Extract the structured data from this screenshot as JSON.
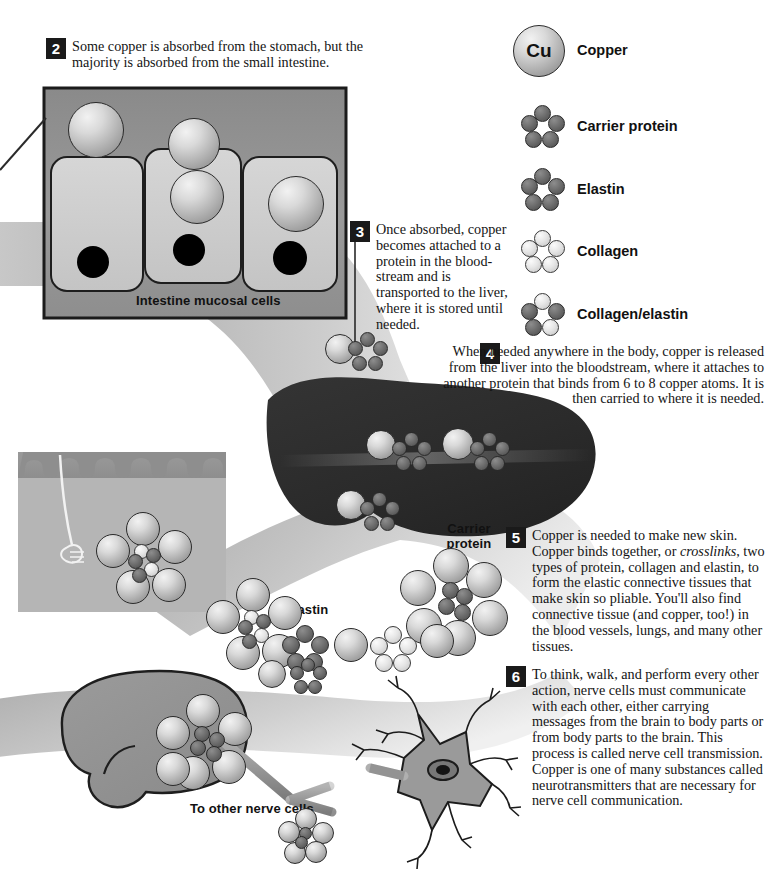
{
  "figure": {
    "steps": [
      {
        "number": "2",
        "text": "Some copper is absorbed from the stomach, but the majority is absorbed from the small intestine."
      },
      {
        "number": "3",
        "text": "Once absorbed, copper becomes attached to a protein in the blood-stream and is transported to the liver, where it is stored until needed."
      },
      {
        "number": "4",
        "text": "When needed anywhere in the body, copper is released from the liver into the bloodstream, where it attaches to another protein that binds from 6 to 8 copper atoms. It is then carried to where it is needed."
      },
      {
        "number": "5",
        "text_parts": [
          "Copper is needed to make new skin. Copper binds together, or ",
          "crosslinks",
          ", two types of protein, collagen and elastin, to form the elastic connective tissues that make skin so pliable. You'll also find connective tissue (and copper, too!) in the blood vessels, lungs, and many other tissues."
        ]
      },
      {
        "number": "6",
        "text": "To think, walk, and perform every other action, nerve cells must communicate with each other, either carrying messages from the brain to body parts or from body parts to the brain. This process is called nerve cell transmission. Copper is one of many substances called neurotransmitters that are necessary for nerve cell communication."
      }
    ],
    "diagram_labels": {
      "intestine": "Intestine mucosal cells",
      "carrier_protein": "Carrier\nprotein",
      "carrier_protein_line1": "Carrier",
      "carrier_protein_line2": "protein",
      "elastin": "Elastin",
      "nerve": "To other nerve cells"
    },
    "copper_symbol": "Cu"
  },
  "legend": {
    "items": [
      {
        "label": "Copper",
        "icon": "copper-atom-icon",
        "type": "single"
      },
      {
        "label": "Carrier protein",
        "icon": "carrier-protein-icon",
        "type": "cluster-dark"
      },
      {
        "label": "Elastin",
        "icon": "elastin-icon",
        "type": "cluster-dark"
      },
      {
        "label": "Collagen",
        "icon": "collagen-icon",
        "type": "cluster-light"
      },
      {
        "label": "Collagen/elastin",
        "icon": "collagen-elastin-icon",
        "type": "cluster-mixed"
      }
    ]
  },
  "colors": {
    "copper_fill": "#d9d9d9",
    "dark_atom": "#5a5a5a",
    "light_atom": "#e6e6e6",
    "liver": "#2e2e2e",
    "bloodstream": "#b9b9b9",
    "intestine_box_bg": "#8f8f8f",
    "mucosal_cell": "#cfcfcf",
    "nerve_cell": "#8f8f8f",
    "skin_inset_bg": "#b5b5b5",
    "text": "#141414",
    "badge_bg": "#1a1a1a",
    "badge_text": "#ffffff"
  }
}
